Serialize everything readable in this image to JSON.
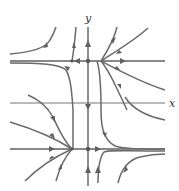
{
  "figure": {
    "type": "phase_portrait",
    "axes": {
      "x_label": "x",
      "y_label": "y"
    },
    "equilibrium_lines": [
      {
        "name": "upper",
        "y_px": 61
      },
      {
        "name": "lower",
        "y_px": 149
      }
    ],
    "equilibrium_points": [
      {
        "name": "upper-equilibrium",
        "x_px": 88,
        "y_px": 61
      },
      {
        "name": "lower-equilibrium",
        "x_px": 88,
        "y_px": 149
      }
    ],
    "colors": {
      "trajectory": "#6a6a6a",
      "axis": "#777777",
      "background": "#ffffff"
    }
  }
}
